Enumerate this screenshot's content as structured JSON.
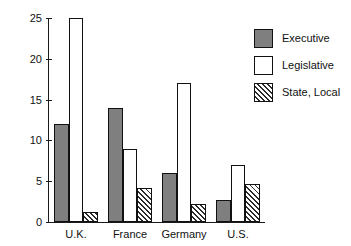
{
  "chart_data": {
    "type": "bar",
    "title": "",
    "subtitle": "",
    "xlabel": "",
    "ylabel": "",
    "categories": [
      "U.K.",
      "France",
      "Germany",
      "U.S."
    ],
    "series": [
      {
        "name": "Executive",
        "values": [
          12,
          14,
          6,
          2.7
        ],
        "fill": "solid-gray",
        "color": "#7f7f7f"
      },
      {
        "name": "Legislative",
        "values": [
          25,
          9,
          17,
          7
        ],
        "fill": "solid-white",
        "color": "#ffffff"
      },
      {
        "name": "State, Local",
        "values": [
          1.2,
          4.2,
          2.2,
          4.7
        ],
        "fill": "diagonal-hatch",
        "color": "#ffffff"
      }
    ],
    "ylim": [
      0,
      25
    ],
    "yticks": [
      0,
      5,
      10,
      15,
      20,
      25
    ],
    "ytick_labels": [
      "0",
      "5",
      "10",
      "15",
      "20",
      "25"
    ],
    "grid": false,
    "legend_position": "upper-right",
    "legend_entries": [
      "Executive",
      "Legislative",
      "State, Local"
    ],
    "axis_color": "#1a1a1a",
    "bar_edge_color": "#111111",
    "background": "#ffffff"
  }
}
